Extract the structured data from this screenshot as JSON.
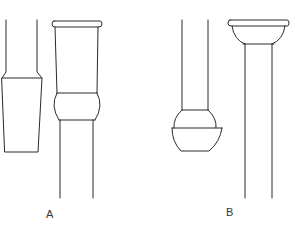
{
  "diagram": {
    "type": "glassware-joints",
    "figures": [
      {
        "id": "A",
        "label": "A",
        "parts": [
          "tapered-inner-joint",
          "tapered-outer-socket"
        ]
      },
      {
        "id": "B",
        "label": "B",
        "parts": [
          "ball-joint",
          "cup-socket"
        ]
      }
    ],
    "colors": {
      "line": "#2a2a2a",
      "background": "#ffffff"
    }
  }
}
